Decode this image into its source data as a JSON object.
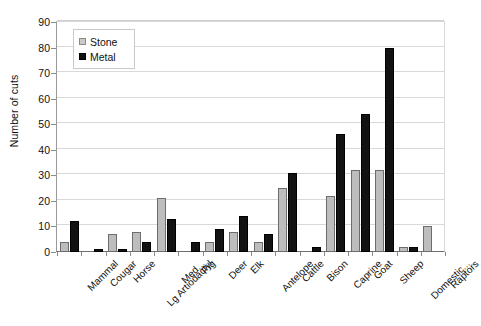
{
  "chart_data": {
    "type": "bar",
    "title": "",
    "xlabel": "",
    "ylabel": "Number of cuts",
    "ylim": [
      0,
      90
    ],
    "ytick_step": 10,
    "yticks": [
      90,
      80,
      70,
      60,
      50,
      40,
      30,
      20,
      10,
      0
    ],
    "grid": true,
    "legend_position": "top-left inside plot",
    "categories": [
      "Mammal",
      "Cougar",
      "Horse",
      "Lg Artiodactyl",
      "Med...",
      "Pig",
      "Deer",
      "Elk",
      "Antelope",
      "Cattle",
      "Bison",
      "Caprine",
      "Goat",
      "Sheep",
      "Domestic...",
      "Raptors"
    ],
    "series": [
      {
        "name": "Stone",
        "color": "#bdbdbd",
        "values": [
          4,
          0,
          7,
          8,
          21,
          0,
          4,
          8,
          4,
          25,
          0,
          22,
          32,
          32,
          2,
          10
        ]
      },
      {
        "name": "Metal",
        "color": "#121212",
        "values": [
          12,
          1,
          1,
          4,
          13,
          4,
          9,
          14,
          7,
          31,
          2,
          46,
          54,
          80,
          2,
          0
        ]
      }
    ]
  },
  "legend": {
    "items": [
      {
        "label": "Stone",
        "swatch": "stone-swatch-icon"
      },
      {
        "label": "Metal",
        "swatch": "metal-swatch-icon"
      }
    ]
  }
}
